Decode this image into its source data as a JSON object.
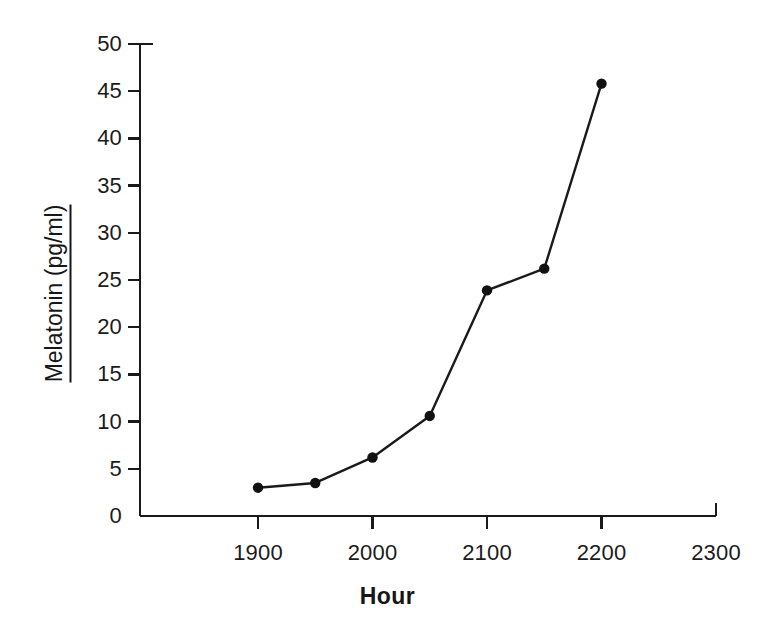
{
  "chart_data": {
    "type": "line",
    "title": "",
    "subtitle": "",
    "xlabel": "Hour",
    "ylabel": "Melatonin (pg/ml)",
    "x": [
      1900,
      1950,
      2000,
      2050,
      2100,
      2150,
      2200
    ],
    "values": [
      3.0,
      3.5,
      6.2,
      10.6,
      23.9,
      26.2,
      45.8
    ],
    "series": [
      {
        "name": "Melatonin",
        "values": [
          3.0,
          3.5,
          6.2,
          10.6,
          23.9,
          26.2,
          45.8
        ]
      }
    ],
    "xlim": [
      1860,
      2300
    ],
    "ylim": [
      0,
      50
    ],
    "xticks": [
      1900,
      2000,
      2100,
      2200,
      2300
    ],
    "xtick_labels": [
      "1900",
      "2000",
      "2100",
      "2200",
      "2300"
    ],
    "yticks": [
      0,
      5,
      10,
      15,
      20,
      25,
      30,
      35,
      40,
      45,
      50
    ],
    "ytick_labels": [
      "0",
      "5",
      "10",
      "15",
      "20",
      "25",
      "30",
      "35",
      "40",
      "45",
      "50"
    ],
    "grid": false,
    "legend": false,
    "legend_position": "none",
    "marker": "filled-circle",
    "line_color": "#1a1a1a",
    "marker_color": "#111111",
    "background_color": "#ffffff",
    "axis_color": "#1a1a1a"
  }
}
